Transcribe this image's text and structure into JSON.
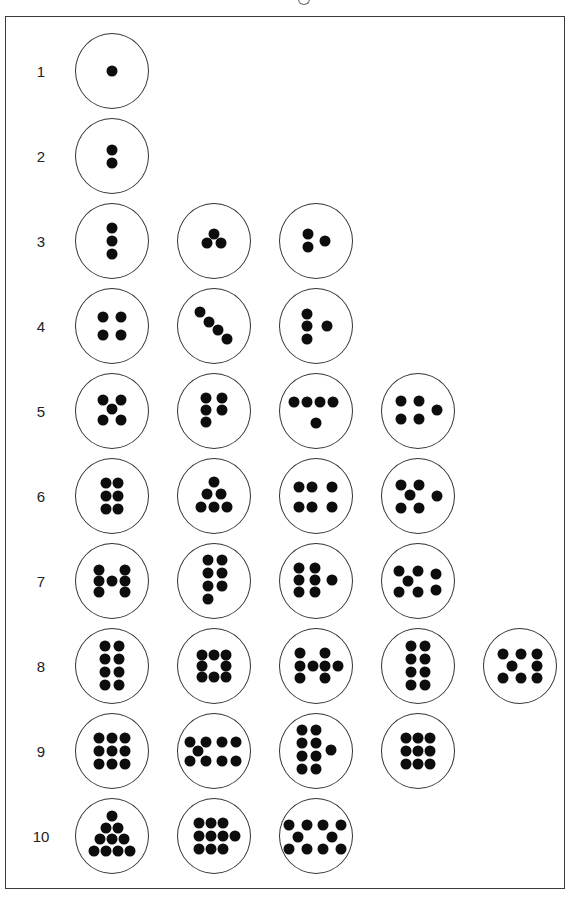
{
  "figure": {
    "dot_color": "#0d0d0d",
    "circle_border_color": "#333333",
    "rows": [
      {
        "label": "1",
        "y": 71,
        "patterns": [
          {
            "count": 1,
            "dots": [
              [
                0,
                0
              ]
            ]
          }
        ]
      },
      {
        "label": "2",
        "y": 156,
        "patterns": [
          {
            "count": 2,
            "dots": [
              [
                0,
                -6
              ],
              [
                0,
                7
              ]
            ]
          }
        ]
      },
      {
        "label": "3",
        "y": 241,
        "patterns": [
          {
            "count": 3,
            "dots": [
              [
                0,
                -13
              ],
              [
                0,
                0
              ],
              [
                0,
                13
              ]
            ]
          },
          {
            "count": 3,
            "dots": [
              [
                0,
                -7
              ],
              [
                -7,
                2
              ],
              [
                7,
                2
              ]
            ]
          },
          {
            "count": 3,
            "dots": [
              [
                -8,
                -7
              ],
              [
                -8,
                6
              ],
              [
                9,
                0
              ]
            ]
          }
        ]
      },
      {
        "label": "4",
        "y": 326,
        "patterns": [
          {
            "count": 4,
            "dots": [
              [
                -9,
                -9
              ],
              [
                9,
                -9
              ],
              [
                -9,
                9
              ],
              [
                9,
                9
              ]
            ]
          },
          {
            "count": 4,
            "dots": [
              [
                -14,
                -14
              ],
              [
                -5,
                -4
              ],
              [
                4,
                4
              ],
              [
                13,
                13
              ]
            ]
          },
          {
            "count": 4,
            "dots": [
              [
                -9,
                -12
              ],
              [
                -9,
                0
              ],
              [
                -9,
                13
              ],
              [
                11,
                0
              ]
            ]
          }
        ]
      },
      {
        "label": "5",
        "y": 411,
        "patterns": [
          {
            "count": 5,
            "dots": [
              [
                -9,
                -11
              ],
              [
                9,
                -11
              ],
              [
                0,
                -2
              ],
              [
                -9,
                9
              ],
              [
                9,
                9
              ]
            ]
          },
          {
            "count": 5,
            "dots": [
              [
                -8,
                -13
              ],
              [
                8,
                -13
              ],
              [
                -8,
                -1
              ],
              [
                8,
                -1
              ],
              [
                -8,
                11
              ]
            ]
          },
          {
            "count": 5,
            "dots": [
              [
                -22,
                -9
              ],
              [
                -9,
                -9
              ],
              [
                4,
                -9
              ],
              [
                17,
                -9
              ],
              [
                0,
                12
              ]
            ]
          },
          {
            "count": 5,
            "dots": [
              [
                -17,
                -10
              ],
              [
                1,
                -10
              ],
              [
                -17,
                8
              ],
              [
                1,
                8
              ],
              [
                19,
                -1
              ]
            ]
          }
        ]
      },
      {
        "label": "6",
        "y": 496,
        "patterns": [
          {
            "count": 6,
            "dots": [
              [
                -6,
                -13
              ],
              [
                6,
                -13
              ],
              [
                -6,
                0
              ],
              [
                6,
                0
              ],
              [
                -6,
                13
              ],
              [
                6,
                13
              ]
            ]
          },
          {
            "count": 6,
            "dots": [
              [
                0,
                -14
              ],
              [
                -7,
                -2
              ],
              [
                7,
                -2
              ],
              [
                -13,
                11
              ],
              [
                0,
                11
              ],
              [
                13,
                11
              ]
            ]
          },
          {
            "count": 6,
            "dots": [
              [
                -17,
                -9
              ],
              [
                -4,
                -9
              ],
              [
                16,
                -9
              ],
              [
                -17,
                11
              ],
              [
                -4,
                11
              ],
              [
                16,
                11
              ]
            ]
          },
          {
            "count": 6,
            "dots": [
              [
                -17,
                -11
              ],
              [
                1,
                -11
              ],
              [
                -8,
                -1
              ],
              [
                -17,
                12
              ],
              [
                1,
                12
              ],
              [
                19,
                0
              ]
            ]
          }
        ]
      },
      {
        "label": "7",
        "y": 581,
        "patterns": [
          {
            "count": 7,
            "dots": [
              [
                -13,
                -11
              ],
              [
                13,
                -11
              ],
              [
                -13,
                0
              ],
              [
                0,
                0
              ],
              [
                13,
                0
              ],
              [
                -13,
                11
              ],
              [
                13,
                11
              ]
            ]
          },
          {
            "count": 7,
            "dots": [
              [
                -6,
                -21
              ],
              [
                8,
                -21
              ],
              [
                -6,
                -8
              ],
              [
                8,
                -8
              ],
              [
                -6,
                5
              ],
              [
                8,
                5
              ],
              [
                -6,
                18
              ]
            ]
          },
          {
            "count": 7,
            "dots": [
              [
                -17,
                -13
              ],
              [
                -1,
                -13
              ],
              [
                -17,
                -1
              ],
              [
                -1,
                -1
              ],
              [
                16,
                -1
              ],
              [
                -17,
                11
              ],
              [
                -1,
                11
              ]
            ]
          },
          {
            "count": 7,
            "dots": [
              [
                -19,
                -10
              ],
              [
                0,
                -10
              ],
              [
                -10,
                0
              ],
              [
                -19,
                11
              ],
              [
                0,
                11
              ],
              [
                18,
                -7
              ],
              [
                18,
                9
              ]
            ]
          }
        ]
      },
      {
        "label": "8",
        "y": 666,
        "patterns": [
          {
            "count": 8,
            "dots": [
              [
                -7,
                -20
              ],
              [
                7,
                -20
              ],
              [
                -7,
                -7
              ],
              [
                7,
                -7
              ],
              [
                -7,
                6
              ],
              [
                7,
                6
              ],
              [
                -7,
                19
              ],
              [
                7,
                19
              ]
            ]
          },
          {
            "count": 8,
            "dots": [
              [
                -12,
                -11
              ],
              [
                0,
                -11
              ],
              [
                12,
                -11
              ],
              [
                -12,
                0
              ],
              [
                12,
                0
              ],
              [
                -12,
                11
              ],
              [
                0,
                11
              ],
              [
                12,
                11
              ]
            ]
          },
          {
            "count": 8,
            "dots": [
              [
                -16,
                -13
              ],
              [
                -16,
                0
              ],
              [
                -16,
                12
              ],
              [
                -3,
                0
              ],
              [
                9,
                -13
              ],
              [
                9,
                0
              ],
              [
                9,
                12
              ],
              [
                22,
                0
              ]
            ]
          },
          {
            "count": 8,
            "dots": [
              [
                -7,
                -20
              ],
              [
                7,
                -20
              ],
              [
                -7,
                -7
              ],
              [
                7,
                -7
              ],
              [
                -7,
                6
              ],
              [
                7,
                6
              ],
              [
                -7,
                19
              ],
              [
                7,
                19
              ]
            ]
          },
          {
            "count": 8,
            "dots": [
              [
                -17,
                -12
              ],
              [
                1,
                -12
              ],
              [
                17,
                -12
              ],
              [
                -8,
                0
              ],
              [
                17,
                0
              ],
              [
                -17,
                12
              ],
              [
                1,
                12
              ],
              [
                17,
                12
              ]
            ]
          }
        ]
      },
      {
        "label": "9",
        "y": 751,
        "patterns": [
          {
            "count": 9,
            "dots": [
              [
                -13,
                -13
              ],
              [
                0,
                -13
              ],
              [
                13,
                -13
              ],
              [
                -13,
                0
              ],
              [
                0,
                0
              ],
              [
                13,
                0
              ],
              [
                -13,
                13
              ],
              [
                0,
                13
              ],
              [
                13,
                13
              ]
            ]
          },
          {
            "count": 9,
            "dots": [
              [
                -24,
                -9
              ],
              [
                -8,
                -9
              ],
              [
                8,
                -9
              ],
              [
                22,
                -9
              ],
              [
                -16,
                0
              ],
              [
                -24,
                10
              ],
              [
                -8,
                10
              ],
              [
                8,
                10
              ],
              [
                22,
                10
              ]
            ]
          },
          {
            "count": 9,
            "dots": [
              [
                -14,
                -21
              ],
              [
                0,
                -21
              ],
              [
                -14,
                -8
              ],
              [
                0,
                -8
              ],
              [
                -14,
                5
              ],
              [
                0,
                5
              ],
              [
                -14,
                18
              ],
              [
                0,
                18
              ],
              [
                15,
                -1
              ]
            ]
          },
          {
            "count": 9,
            "dots": [
              [
                -12,
                -13
              ],
              [
                0,
                -13
              ],
              [
                12,
                -13
              ],
              [
                -12,
                0
              ],
              [
                0,
                0
              ],
              [
                12,
                0
              ],
              [
                -12,
                13
              ],
              [
                0,
                13
              ],
              [
                12,
                13
              ]
            ]
          }
        ]
      },
      {
        "label": "10",
        "y": 836,
        "patterns": [
          {
            "count": 10,
            "dots": [
              [
                0,
                -20
              ],
              [
                -6,
                -8
              ],
              [
                6,
                -8
              ],
              [
                -12,
                3
              ],
              [
                0,
                3
              ],
              [
                12,
                3
              ],
              [
                -18,
                15
              ],
              [
                -6,
                15
              ],
              [
                6,
                15
              ],
              [
                18,
                15
              ]
            ]
          },
          {
            "count": 10,
            "dots": [
              [
                -15,
                -13
              ],
              [
                -3,
                -13
              ],
              [
                9,
                -13
              ],
              [
                -15,
                0
              ],
              [
                -3,
                0
              ],
              [
                9,
                0
              ],
              [
                21,
                0
              ],
              [
                -15,
                13
              ],
              [
                -3,
                13
              ],
              [
                9,
                13
              ]
            ]
          },
          {
            "count": 10,
            "dots": [
              [
                -27,
                -11
              ],
              [
                -9,
                -11
              ],
              [
                7,
                -11
              ],
              [
                25,
                -11
              ],
              [
                -18,
                1
              ],
              [
                16,
                1
              ],
              [
                -27,
                13
              ],
              [
                -9,
                13
              ],
              [
                7,
                13
              ],
              [
                25,
                13
              ]
            ]
          }
        ]
      }
    ],
    "column_x": [
      112,
      214,
      316,
      418,
      520
    ],
    "label_x": 41
  }
}
